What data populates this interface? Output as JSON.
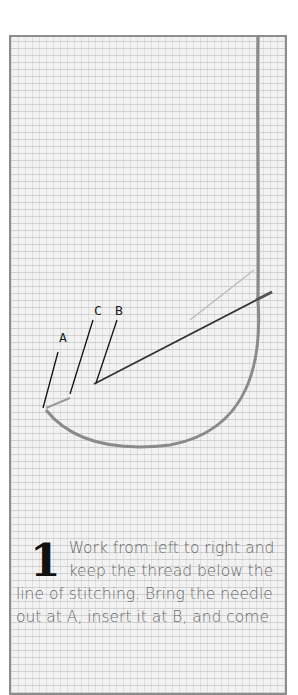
{
  "figure": {
    "labels": {
      "a": "A",
      "b": "B",
      "c": "C"
    }
  },
  "instruction": {
    "step_number": "1",
    "text": "Work from left to right and keep the thread below the line of stitching. Bring the needle out at A, insert it at B, and come"
  },
  "colors": {
    "frame_border": "#8c8c8c",
    "fabric": "#f2f2f2",
    "thread": "#8a8a8a",
    "needle": "#333333",
    "caption_text": "#6a6a6a",
    "step_number": "#111111"
  }
}
